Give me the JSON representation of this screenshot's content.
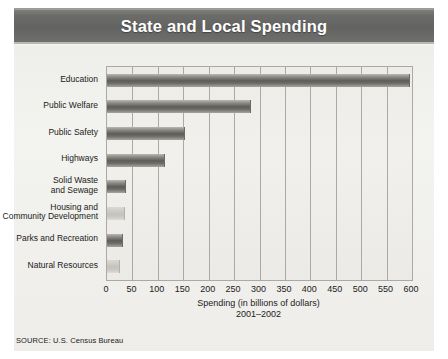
{
  "header": {
    "title": "State and Local Spending"
  },
  "source": "SOURCE: U.S. Census Bureau",
  "chart_data": {
    "type": "bar",
    "orientation": "horizontal",
    "title": "State and Local Spending",
    "xlabel": "Spending (in billions of dollars)",
    "xlabel_sub": "2001–2002",
    "ylabel": "",
    "xlim": [
      0,
      600
    ],
    "xticks": [
      0,
      50,
      100,
      150,
      200,
      250,
      300,
      350,
      400,
      450,
      500,
      550,
      600
    ],
    "grid": true,
    "legend": false,
    "categories": [
      "Education",
      "Public Welfare",
      "Public Safety",
      "Highways",
      "Solid Waste\nand Sewage",
      "Housing and\nCommunity Development",
      "Parks and Recreation",
      "Natural Resources"
    ],
    "values": [
      594,
      281,
      152,
      112,
      36,
      34,
      30,
      24
    ],
    "bar_shades": [
      "dark",
      "dark",
      "dark",
      "dark",
      "dark",
      "light",
      "dark",
      "light"
    ],
    "colors": {
      "bar_dark": "#5d5c58",
      "bar_light": "#c9c8c3",
      "banner": "#6b6b69",
      "panel": "#f1f0ed",
      "grid": "#a9a9a6",
      "text": "#1b1b1b"
    }
  }
}
